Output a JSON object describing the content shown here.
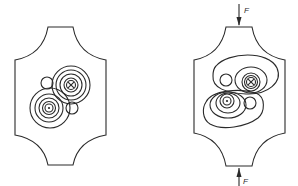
{
  "figure": {
    "left_panel": {
      "state": "unloaded",
      "symbols": [
        "current-into-page",
        "current-out-of-page"
      ],
      "contours": "concentric circles around each conductor"
    },
    "right_panel": {
      "state": "loaded",
      "force_top_label": "F",
      "force_bottom_label": "F",
      "contours": "distorted elongated loops enclosing each conductor and adjacent small hole"
    }
  }
}
